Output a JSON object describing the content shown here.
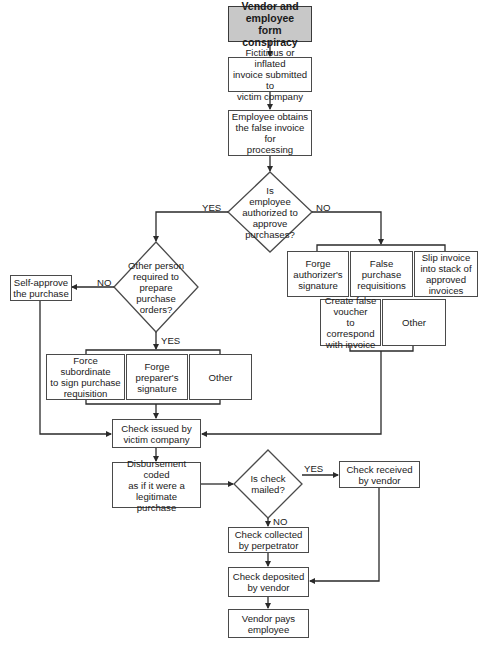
{
  "diagram": {
    "start": "Vendor and\nemployee\nform conspiracy",
    "steps": {
      "invoice_submitted": "Fictitious or inflated\ninvoice submitted to\nvictim company",
      "employee_obtains": "Employee obtains\nthe false invoice for\nprocessing",
      "self_approve": "Self-approve\nthe purchase",
      "check_issued": "Check issued by\nvictim company",
      "disbursement_coded": "Disbursement coded\nas if it were a\nlegitimate purchase",
      "check_received": "Check received\nby vendor",
      "check_collected": "Check collected\nby perpetrator",
      "check_deposited": "Check deposited\nby vendor",
      "vendor_pays": "Vendor pays\nemployee"
    },
    "decisions": {
      "authorized": "Is\nemployee\nauthorized to\napprove\npurchases?",
      "other_person": "Other person\nrequired to\nprepare\npurchase\norders?",
      "check_mailed": "Is check\nmailed?"
    },
    "left_options": [
      "Force subordinate\nto sign purchase\nrequisition",
      "Forge\npreparer's\nsignature",
      "Other"
    ],
    "right_options_row1": [
      "Forge\nauthorizer's\nsignature",
      "False\npurchase\nrequisitions",
      "Slip invoice\ninto stack of\napproved\ninvoices"
    ],
    "right_options_row2": [
      "Create false\nvoucher\nto correspond\nwith invoice",
      "Other"
    ],
    "edge_labels": {
      "authorized_yes": "YES",
      "authorized_no": "NO",
      "other_person_no": "NO",
      "other_person_yes": "YES",
      "mailed_yes": "YES",
      "mailed_no": "NO"
    },
    "colors": {
      "start_fill": "#c8c8c8",
      "line": "#2a2a2a",
      "box_border": "#4a4a4a"
    }
  }
}
